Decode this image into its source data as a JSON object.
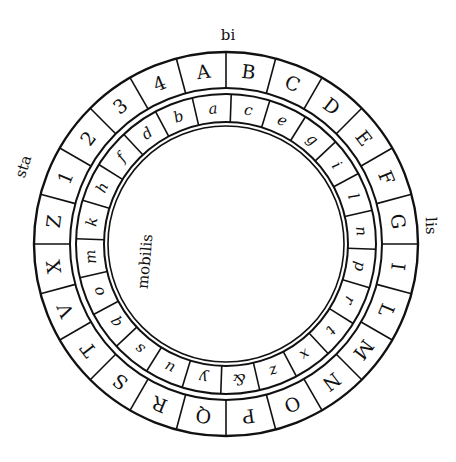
{
  "diagram": {
    "type": "cipher-disk",
    "colors": {
      "ink": "#111111",
      "paper": "#ffffff"
    },
    "geometry": {
      "center": [
        226,
        244
      ],
      "outer_ring": {
        "outer_radius": 192,
        "inner_radius": 156
      },
      "inner_ring": {
        "outer_radius": 150,
        "inner_radius": 122
      },
      "innermost_radius": 118,
      "cell_count": 24,
      "start_angle_deg": -15
    },
    "labels": {
      "top": "bi",
      "left": "sta",
      "right": "lis",
      "center": "mobilis"
    },
    "outer_ring": {
      "name": "stabilis",
      "cells": [
        "A",
        "B",
        "C",
        "D",
        "E",
        "F",
        "G",
        "I",
        "L",
        "M",
        "N",
        "O",
        "P",
        "Q",
        "R",
        "S",
        "T",
        "V",
        "X",
        "Z",
        "1",
        "2",
        "3",
        "4"
      ]
    },
    "inner_ring": {
      "name": "mobilis",
      "cells": [
        "a",
        "c",
        "e",
        "g",
        "i",
        "l",
        "n",
        "p",
        "r",
        "t",
        "x",
        "z",
        "&",
        "y",
        "u",
        "s",
        "q",
        "o",
        "m",
        "k",
        "h",
        "f",
        "d",
        "b"
      ]
    }
  }
}
